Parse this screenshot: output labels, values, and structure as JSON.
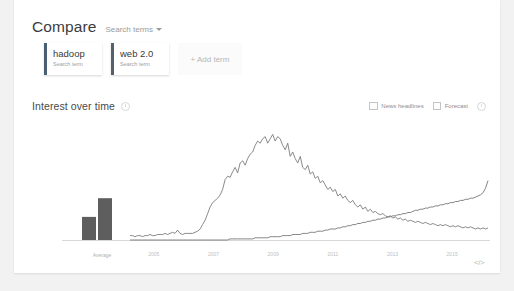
{
  "compare": {
    "title": "Compare",
    "dropdown_label": "Search terms",
    "caret_icon": "chevron-down-icon",
    "terms": [
      {
        "name": "hadoop",
        "subtitle": "Search term",
        "accent": "#4b5f72"
      },
      {
        "name": "web 2.0",
        "subtitle": "Search term",
        "accent": "#56606b"
      }
    ],
    "add_term_label": "+ Add term"
  },
  "interest_over_time": {
    "title": "Interest over time",
    "info_icon": "info-icon",
    "options": [
      {
        "label": "News headlines",
        "checked": false
      },
      {
        "label": "Forecast",
        "checked": false
      }
    ],
    "embed_label": "</>",
    "embed_icon": "embed-code-icon"
  },
  "chart_data": {
    "type": "line",
    "title": "Interest over time",
    "xlabel": "",
    "ylabel": "",
    "ylim": [
      0,
      100
    ],
    "grid": false,
    "legend_position": "none",
    "average_bars": {
      "type": "bar",
      "axis_label": "Average",
      "categories": [
        "hadoop",
        "web 2.0"
      ],
      "values": [
        21,
        38
      ],
      "color": "#5e5e5e"
    },
    "x_tick_labels": [
      "2005",
      "2007",
      "2009",
      "2011",
      "2013",
      "2015"
    ],
    "x_start": "2004",
    "x_end": "2015",
    "series": [
      {
        "name": "web 2.0",
        "color": "#757575",
        "values": [
          4,
          4,
          3,
          4,
          4,
          3,
          4,
          4,
          5,
          4,
          4,
          5,
          5,
          5,
          6,
          5,
          6,
          7,
          6,
          9,
          6,
          5,
          6,
          6,
          6,
          6,
          7,
          8,
          10,
          14,
          18,
          24,
          30,
          34,
          36,
          38,
          41,
          46,
          55,
          58,
          57,
          62,
          66,
          61,
          70,
          72,
          68,
          74,
          78,
          80,
          86,
          90,
          88,
          92,
          94,
          88,
          92,
          96,
          90,
          94,
          92,
          86,
          82,
          88,
          76,
          80,
          74,
          70,
          76,
          66,
          64,
          68,
          60,
          62,
          56,
          58,
          52,
          54,
          50,
          46,
          48,
          44,
          46,
          40,
          42,
          38,
          40,
          36,
          34,
          36,
          32,
          30,
          32,
          28,
          30,
          26,
          28,
          25,
          26,
          24,
          23,
          24,
          22,
          21,
          22,
          20,
          21,
          19,
          20,
          18,
          19,
          17,
          18,
          17,
          16,
          17,
          16,
          15,
          16,
          15,
          14,
          15,
          14,
          13,
          14,
          13,
          14,
          13,
          12,
          13,
          12,
          13,
          12,
          11,
          12,
          11,
          12,
          11,
          10,
          11,
          10,
          11,
          10,
          11
        ]
      },
      {
        "name": "hadoop",
        "color": "#6e6e6e",
        "values": [
          0,
          0,
          0,
          0,
          0,
          0,
          0,
          0,
          0,
          0,
          0,
          0,
          0,
          0,
          0,
          0,
          0,
          0,
          0,
          0,
          0,
          0,
          0,
          0,
          0,
          0,
          0,
          0,
          0,
          0,
          0,
          0,
          0,
          0,
          0,
          0,
          0,
          0,
          0,
          0,
          1,
          1,
          1,
          1,
          1,
          1,
          1,
          1,
          1,
          1,
          2,
          2,
          2,
          2,
          2,
          2,
          3,
          3,
          3,
          3,
          3,
          4,
          4,
          4,
          4,
          5,
          5,
          5,
          5,
          6,
          6,
          6,
          7,
          7,
          7,
          8,
          8,
          8,
          9,
          9,
          10,
          10,
          10,
          11,
          11,
          12,
          12,
          13,
          13,
          14,
          14,
          15,
          15,
          16,
          16,
          17,
          17,
          18,
          18,
          19,
          19,
          20,
          20,
          21,
          21,
          22,
          22,
          23,
          23,
          24,
          24,
          25,
          25,
          26,
          27,
          27,
          28,
          28,
          29,
          29,
          30,
          30,
          31,
          31,
          32,
          32,
          33,
          33,
          34,
          34,
          35,
          35,
          36,
          36,
          37,
          37,
          38,
          38,
          39,
          40,
          41,
          43,
          47,
          54
        ]
      }
    ]
  }
}
